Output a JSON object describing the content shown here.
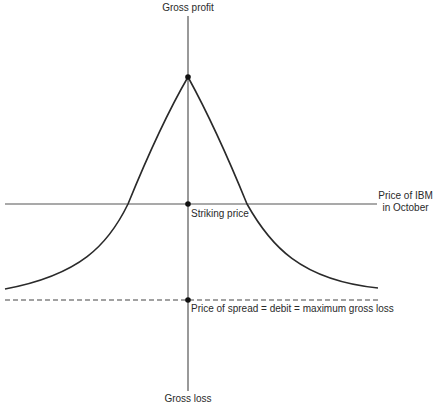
{
  "diagram": {
    "type": "payoff-diagram",
    "axes": {
      "vertical_top_label": "Gross profit",
      "vertical_bottom_label": "Gross loss",
      "horizontal_label_line1": "Price of IBM",
      "horizontal_label_line2": "in October"
    },
    "annotations": {
      "striking_price": "Striking price",
      "max_loss": "Price of spread = debit = maximum gross loss"
    },
    "points": [
      {
        "name": "peak",
        "x": 188,
        "y": 77
      },
      {
        "name": "strike",
        "x": 188,
        "y": 204
      },
      {
        "name": "max-loss",
        "x": 188,
        "y": 300
      }
    ],
    "colors": {
      "line": "#2a2a2a",
      "axis": "#555555",
      "background": "#ffffff"
    }
  }
}
